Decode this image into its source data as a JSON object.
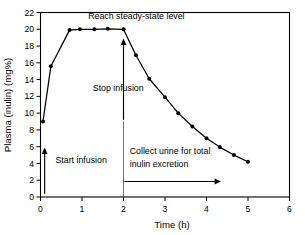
{
  "chart_data": {
    "type": "line",
    "title": "",
    "xlabel": "Time (h)",
    "ylabel": "Plasma (inulin) (mg%)",
    "xlim": [
      0,
      6
    ],
    "ylim": [
      0,
      22
    ],
    "xticks": [
      "0",
      "1",
      "2",
      "3",
      "4",
      "5",
      "6"
    ],
    "xtick_values": [
      0,
      1,
      2,
      3,
      4,
      5,
      6
    ],
    "yticks": [
      "0",
      "2",
      "4",
      "6",
      "8",
      "10",
      "12",
      "14",
      "16",
      "18",
      "20",
      "22"
    ],
    "ytick_values": [
      0,
      2,
      4,
      6,
      8,
      10,
      12,
      14,
      16,
      18,
      20,
      22
    ],
    "grid": false,
    "legend": false,
    "series": [
      {
        "name": "Plasma inulin concentration",
        "x": [
          0.06,
          0.25,
          0.7,
          0.95,
          1.3,
          1.62,
          2.0,
          2.3,
          2.62,
          3.0,
          3.32,
          3.66,
          4.0,
          4.32,
          4.66,
          5.0
        ],
        "y": [
          9.0,
          15.6,
          19.9,
          20.0,
          20.0,
          20.05,
          20.0,
          16.9,
          14.1,
          11.9,
          10.0,
          8.4,
          7.0,
          5.95,
          5.0,
          4.2
        ]
      }
    ],
    "annotations": [
      {
        "id": "steady-state",
        "text": "Reach steady-state level",
        "x": 1.15,
        "y": 21.2
      },
      {
        "id": "stop-infusion",
        "text": "Stop infusion",
        "x": 1.26,
        "y": 12.6
      },
      {
        "id": "start-infusion",
        "text": "Start infusion",
        "x": 0.36,
        "y": 4.0
      },
      {
        "id": "collect-urine-line-1",
        "text": "Collect urine for total",
        "x": 2.15,
        "y": 5.1
      },
      {
        "id": "collect-urine-line-2",
        "text": "inulin excretion",
        "x": 2.15,
        "y": 3.55
      }
    ],
    "markers": [
      {
        "id": "start-infusion-arrow",
        "kind": "up-arrow",
        "x": 0.1,
        "y_from": 0.4,
        "y_to": 5.9
      },
      {
        "id": "stop-infusion-arrow",
        "kind": "up-arrow",
        "x": 2.0,
        "y_from": 9.2,
        "y_to": 18.9
      },
      {
        "id": "stop-infusion-vertical-line",
        "kind": "v-line",
        "x": 2.0,
        "y_from": 0.0,
        "y_to": 9.0
      },
      {
        "id": "collect-urine-arrow",
        "kind": "right-arrow",
        "y": 1.85,
        "x_from": 2.02,
        "x_to": 4.35
      }
    ]
  }
}
